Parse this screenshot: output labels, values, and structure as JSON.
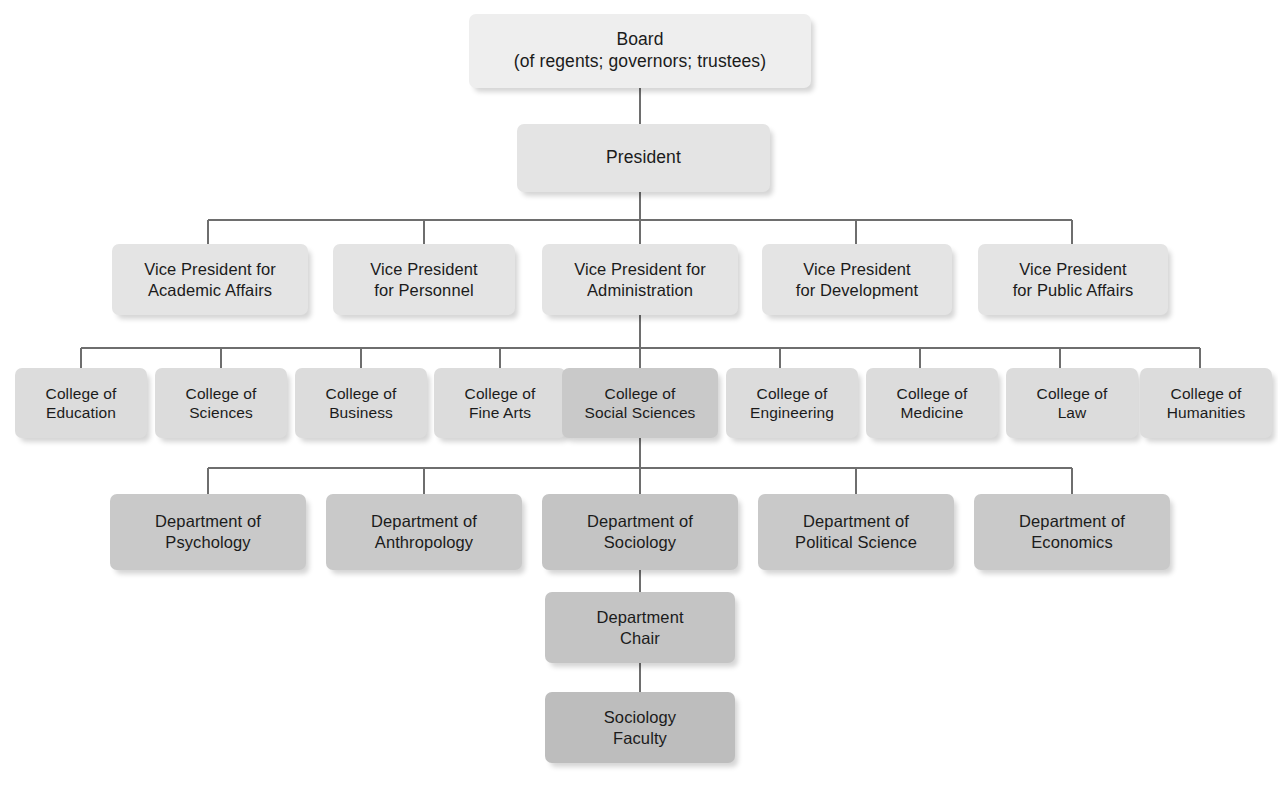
{
  "chart_title": "University Organizational Chart",
  "levels": {
    "board": {
      "label": "Board\n(of regents; governors; trustees)",
      "tone": "#eeeeee"
    },
    "president": {
      "label": "President",
      "tone": "#e8e8e8"
    },
    "vice_presidents": [
      {
        "label": "Vice President for\nAcademic Affairs",
        "tone": "#e8e8e8"
      },
      {
        "label": "Vice President\nfor Personnel",
        "tone": "#e8e8e8"
      },
      {
        "label": "Vice President for\nAdministration",
        "tone": "#e8e8e8"
      },
      {
        "label": "Vice President\nfor Development",
        "tone": "#e8e8e8"
      },
      {
        "label": "Vice President\nfor Public Affairs",
        "tone": "#e8e8e8"
      }
    ],
    "colleges": [
      {
        "label": "College of\nEducation",
        "tone": "#dcdcdc",
        "highlighted": false
      },
      {
        "label": "College of\nSciences",
        "tone": "#dcdcdc",
        "highlighted": false
      },
      {
        "label": "College of\nBusiness",
        "tone": "#dcdcdc",
        "highlighted": false
      },
      {
        "label": "College of\nFine Arts",
        "tone": "#dcdcdc",
        "highlighted": false
      },
      {
        "label": "College of\nSocial Sciences",
        "tone": "#c9c9c9",
        "highlighted": true
      },
      {
        "label": "College of\nEngineering",
        "tone": "#dcdcdc",
        "highlighted": false
      },
      {
        "label": "College of\nMedicine",
        "tone": "#dcdcdc",
        "highlighted": false
      },
      {
        "label": "College of\nLaw",
        "tone": "#dcdcdc",
        "highlighted": false
      },
      {
        "label": "College of\nHumanities",
        "tone": "#dcdcdc",
        "highlighted": false
      }
    ],
    "departments": [
      {
        "label": "Department of\nPsychology",
        "tone": "#c9c9c9",
        "highlighted": false
      },
      {
        "label": "Department of\nAnthropology",
        "tone": "#c9c9c9",
        "highlighted": false
      },
      {
        "label": "Department of\nSociology",
        "tone": "#c4c4c4",
        "highlighted": true
      },
      {
        "label": "Department of\nPolitical Science",
        "tone": "#c9c9c9",
        "highlighted": false
      },
      {
        "label": "Department of\nEconomics",
        "tone": "#c9c9c9",
        "highlighted": false
      }
    ],
    "department_chair": {
      "label": "Department\nChair",
      "tone": "#c4c4c4"
    },
    "faculty": {
      "label": "Sociology\nFaculty",
      "tone": "#bdbdbd"
    }
  },
  "connector_color": "#6e6e6e"
}
